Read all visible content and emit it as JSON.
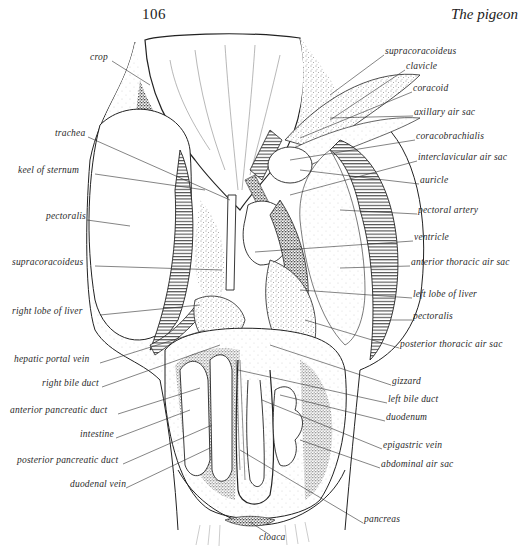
{
  "header": {
    "page_number": "106",
    "running_title": "The pigeon"
  },
  "figure": {
    "left_labels": [
      {
        "text": "crop",
        "x": 90,
        "y": 57
      },
      {
        "text": "trachea",
        "x": 55,
        "y": 133
      },
      {
        "text": "keel of sternum",
        "x": 18,
        "y": 170
      },
      {
        "text": "pectoralis",
        "x": 46,
        "y": 216
      },
      {
        "text": "supracoracoideus",
        "x": 12,
        "y": 262
      },
      {
        "text": "right lobe of liver",
        "x": 12,
        "y": 311
      },
      {
        "text": "hepatic portal vein",
        "x": 14,
        "y": 359
      },
      {
        "text": "right bile duct",
        "x": 42,
        "y": 383
      },
      {
        "text": "anterior pancreatic duct",
        "x": 10,
        "y": 410
      },
      {
        "text": "intestine",
        "x": 80,
        "y": 434
      },
      {
        "text": "posterior pancreatic duct",
        "x": 17,
        "y": 460
      },
      {
        "text": "duodenal vein",
        "x": 70,
        "y": 484
      }
    ],
    "right_labels": [
      {
        "text": "supracoracoideus",
        "x": 385,
        "y": 51
      },
      {
        "text": "clavicle",
        "x": 406,
        "y": 66
      },
      {
        "text": "coracoid",
        "x": 413,
        "y": 88
      },
      {
        "text": "axillary air sac",
        "x": 414,
        "y": 112
      },
      {
        "text": "coracobrachialis",
        "x": 416,
        "y": 136
      },
      {
        "text": "interclavicular air sac",
        "x": 418,
        "y": 157
      },
      {
        "text": "auricle",
        "x": 420,
        "y": 180
      },
      {
        "text": "pectoral artery",
        "x": 418,
        "y": 210
      },
      {
        "text": "ventricle",
        "x": 414,
        "y": 237
      },
      {
        "text": "anterior thoracic air sac",
        "x": 411,
        "y": 262
      },
      {
        "text": "left lobe of liver",
        "x": 413,
        "y": 294
      },
      {
        "text": "pectoralis",
        "x": 413,
        "y": 316
      },
      {
        "text": "posterior thoracic air sac",
        "x": 400,
        "y": 344
      },
      {
        "text": "gizzard",
        "x": 392,
        "y": 381
      },
      {
        "text": "left bile duct",
        "x": 388,
        "y": 399
      },
      {
        "text": "duodenum",
        "x": 386,
        "y": 417
      },
      {
        "text": "epigastric vein",
        "x": 383,
        "y": 445
      },
      {
        "text": "abdominal air sac",
        "x": 381,
        "y": 464
      },
      {
        "text": "pancreas",
        "x": 364,
        "y": 519
      }
    ],
    "bottom_labels": [
      {
        "text": "cloaca",
        "x": 259,
        "y": 537
      }
    ]
  }
}
